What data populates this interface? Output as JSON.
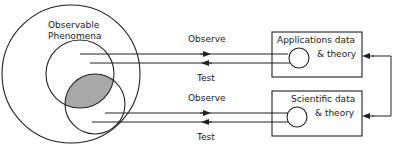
{
  "diagram": {
    "universe_label_line1": "Observable",
    "universe_label_line2": "Phenomena",
    "top_flow": {
      "observe": "Observe",
      "test": "Test"
    },
    "bottom_flow": {
      "observe": "Observe",
      "test": "Test"
    },
    "top_box": {
      "line1": "Applications data",
      "line2": "& theory"
    },
    "bottom_box": {
      "line1": "Scientific data",
      "line2": "& theory"
    },
    "colors": {
      "stroke": "#222222",
      "overlap_fill": "#a8a8a8",
      "background": "#ffffff"
    }
  }
}
